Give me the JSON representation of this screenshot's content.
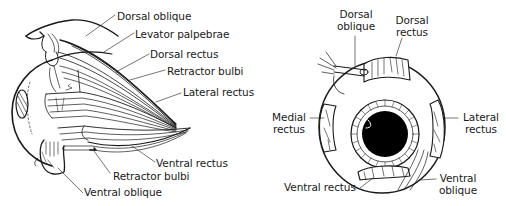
{
  "diagram": {
    "ink_color": "#1a1a1a",
    "background": "#ffffff",
    "lateral_view": {
      "labels": [
        {
          "id": "dorsal-oblique",
          "text": "Dorsal oblique"
        },
        {
          "id": "levator-palpebrae",
          "text": "Levator palpebrae"
        },
        {
          "id": "dorsal-rectus",
          "text": "Dorsal rectus"
        },
        {
          "id": "retractor-bulbi-upper",
          "text": "Retractor bulbi"
        },
        {
          "id": "lateral-rectus",
          "text": "Lateral rectus"
        },
        {
          "id": "ventral-rectus",
          "text": "Ventral rectus"
        },
        {
          "id": "retractor-bulbi-lower",
          "text": "Retractor bulbi"
        },
        {
          "id": "ventral-oblique",
          "text": "Ventral oblique"
        }
      ]
    },
    "anterior_view": {
      "labels": [
        {
          "id": "dorsal-oblique",
          "line1": "Dorsal",
          "line2": "oblique"
        },
        {
          "id": "dorsal-rectus",
          "line1": "Dorsal",
          "line2": "rectus"
        },
        {
          "id": "medial-rectus",
          "line1": "Medial",
          "line2": "rectus"
        },
        {
          "id": "lateral-rectus",
          "line1": "Lateral",
          "line2": "rectus"
        },
        {
          "id": "ventral-rectus",
          "text": "Ventral rectus"
        },
        {
          "id": "ventral-oblique",
          "line1": "Ventral",
          "line2": "oblique"
        }
      ]
    }
  }
}
